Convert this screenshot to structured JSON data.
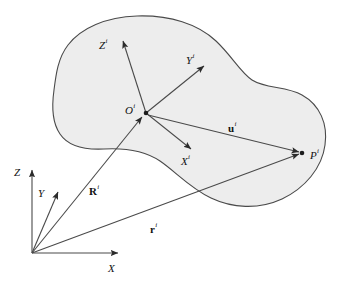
{
  "figure": {
    "type": "technical-diagram",
    "background_color": "#ffffff",
    "line_color": "#3a3a3a",
    "body": {
      "name": "deformable-body",
      "fill_color": "#ededed",
      "stroke_color": "#4a4a4a",
      "stroke_width": 1
    }
  },
  "global_frame": {
    "origin_label": "O",
    "origin_visible": false,
    "axes": [
      {
        "id": "X",
        "base": "X",
        "superscript": ""
      },
      {
        "id": "Y",
        "base": "Y",
        "superscript": ""
      },
      {
        "id": "Z",
        "base": "Z",
        "superscript": ""
      }
    ]
  },
  "body_frame": {
    "origin": {
      "base": "O",
      "superscript": "i"
    },
    "axes": [
      {
        "id": "Xi",
        "base": "X",
        "superscript": "i"
      },
      {
        "id": "Yi",
        "base": "Y",
        "superscript": "i"
      },
      {
        "id": "Zi",
        "base": "Z",
        "superscript": "i"
      }
    ]
  },
  "points": [
    {
      "id": "P",
      "base": "P",
      "superscript": "i",
      "bold": false
    }
  ],
  "vectors": [
    {
      "id": "R",
      "base": "R",
      "superscript": "i",
      "bold": true,
      "description": "position of body origin in global frame"
    },
    {
      "id": "r",
      "base": "r",
      "superscript": "i",
      "bold": true,
      "description": "global position of point P"
    },
    {
      "id": "u",
      "base": "u",
      "superscript": "i",
      "bold": true,
      "description": "local position of point P in body frame"
    }
  ],
  "labels": {
    "X": {
      "base": "X",
      "superscript": ""
    },
    "Y": {
      "base": "Y",
      "superscript": ""
    },
    "Z": {
      "base": "Z",
      "superscript": ""
    },
    "Xi": {
      "base": "X",
      "superscript": "i"
    },
    "Yi": {
      "base": "Y",
      "superscript": "i"
    },
    "Zi": {
      "base": "Z",
      "superscript": "i"
    },
    "Oi": {
      "base": "O",
      "superscript": "i"
    },
    "Pi": {
      "base": "P",
      "superscript": "i"
    },
    "Ri": {
      "base": "R",
      "superscript": "i"
    },
    "ri": {
      "base": "r",
      "superscript": "i"
    },
    "ui": {
      "base": "u",
      "superscript": "i"
    }
  }
}
